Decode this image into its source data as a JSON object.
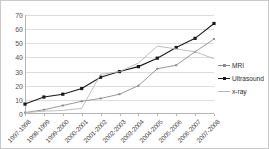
{
  "chart_data": {
    "type": "line",
    "title": "",
    "xlabel": "",
    "ylabel": "",
    "ylim": [
      0,
      70
    ],
    "ytick_step": 10,
    "yticks": [
      "0",
      "10",
      "20",
      "30",
      "40",
      "50",
      "60",
      "70"
    ],
    "grid": true,
    "legend_position": "right",
    "categories": [
      "1997-1998",
      "1998-1999",
      "1999-2000",
      "2000-2001",
      "2001-2002",
      "2002-2003",
      "2003-2004",
      "2004-2005",
      "2005-2006",
      "2006-2007",
      "2007-2008"
    ],
    "series": [
      {
        "name": "MRI",
        "color": "#8c8c8c",
        "marker": "small-square",
        "values": [
          1,
          3,
          6,
          9,
          11,
          14,
          20,
          32,
          34.5,
          44,
          53
        ]
      },
      {
        "name": "Ultrasound",
        "color": "#1a1a1a",
        "marker": "square",
        "values": [
          7,
          12,
          14,
          18,
          26,
          30,
          33.5,
          39.5,
          47,
          53.5,
          64
        ]
      },
      {
        "name": "x-ray",
        "color": "#b8b8b8",
        "marker": "none",
        "values": [
          1,
          2,
          2.5,
          4,
          28,
          30,
          36,
          48,
          46,
          44,
          39
        ]
      }
    ]
  },
  "legend": {
    "items": [
      {
        "label": "MRI"
      },
      {
        "label": "Ultrasound"
      },
      {
        "label": "x-ray"
      }
    ]
  },
  "colors": {
    "axis": "#b5b5b5",
    "grid": "#dddddd",
    "border": "#c9c9c9",
    "background": "#ffffff"
  }
}
